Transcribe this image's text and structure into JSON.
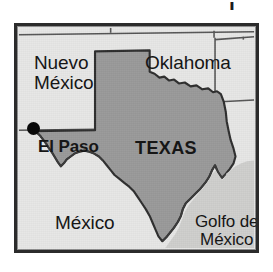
{
  "image": {
    "kind": "locator-map",
    "subject": "Texas",
    "width": 273,
    "height": 272
  },
  "stray_ink": {
    "glyph": "j"
  },
  "map": {
    "frame": {
      "border_color": "#2b2b2b",
      "background_color": "#e7e7e6"
    },
    "highlight": {
      "name": "TEXAS",
      "fill_color": "#9a9a9a",
      "outline_color": "#2e2e2e"
    },
    "labels": [
      {
        "id": "nuevo-mexico",
        "lines": [
          "Nuevo",
          "México"
        ],
        "style": "regular",
        "kind": "state"
      },
      {
        "id": "oklahoma",
        "lines": [
          "Oklahoma"
        ],
        "style": "regular",
        "kind": "state"
      },
      {
        "id": "texas",
        "lines": [
          "TEXAS"
        ],
        "style": "bold",
        "kind": "state-highlighted"
      },
      {
        "id": "el-paso",
        "lines": [
          "El Paso"
        ],
        "style": "bold",
        "kind": "city"
      },
      {
        "id": "mexico",
        "lines": [
          "México"
        ],
        "style": "regular",
        "kind": "country"
      },
      {
        "id": "golfo-de-mexico",
        "lines": [
          "Golfo de",
          "México"
        ],
        "style": "regular",
        "kind": "water-body"
      }
    ],
    "markers": [
      {
        "id": "el-paso-dot",
        "for": "El Paso",
        "color": "#090909"
      }
    ]
  }
}
